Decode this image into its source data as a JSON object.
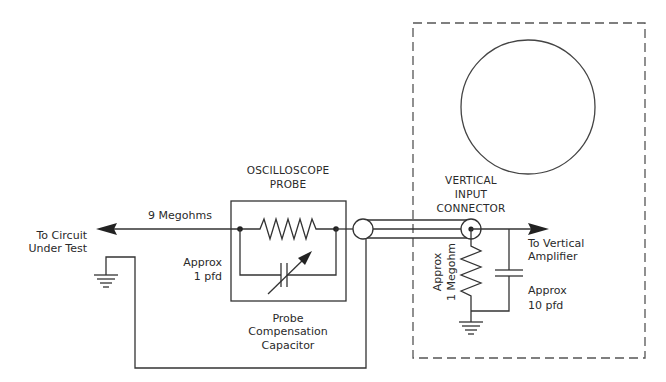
{
  "diagram": {
    "labels": {
      "to_circuit_line1": "To Circuit",
      "to_circuit_line2": "Under Test",
      "nine_megohms": "9 Megohms",
      "approx_1pfd_line1": "Approx",
      "approx_1pfd_line2": "1 pfd",
      "probe_title_line1": "OSCILLOSCOPE",
      "probe_title_line2": "PROBE",
      "probe_comp_line1": "Probe",
      "probe_comp_line2": "Compensation",
      "probe_comp_line3": "Capacitor",
      "connector_line1": "VERTICAL",
      "connector_line2": "INPUT",
      "connector_line3": "CONNECTOR",
      "to_vertical_line1": "To Vertical",
      "to_vertical_line2": "Amplifier",
      "approx_1megohm_line1": "Approx",
      "approx_1megohm_line2": "1 Megohm",
      "approx_10pfd_line1": "Approx",
      "approx_10pfd_line2": "10 pfd"
    },
    "components": [
      {
        "id": "probe-resistor",
        "type": "resistor",
        "value": "9 Megohms"
      },
      {
        "id": "probe-compensation-capacitor",
        "type": "variable-capacitor",
        "value": "Approx 1 pfd"
      },
      {
        "id": "coax-cable",
        "type": "coaxial-cable"
      },
      {
        "id": "vertical-input-connector",
        "type": "connector"
      },
      {
        "id": "input-resistor",
        "type": "resistor",
        "value": "Approx 1 Megohm"
      },
      {
        "id": "input-capacitor",
        "type": "capacitor",
        "value": "Approx 10 pfd"
      },
      {
        "id": "crt-screen",
        "type": "display"
      },
      {
        "id": "probe-ground",
        "type": "ground"
      },
      {
        "id": "scope-ground",
        "type": "ground"
      }
    ],
    "colors": {
      "line": "#333333",
      "text": "#2a2a2a",
      "background": "#ffffff"
    }
  }
}
